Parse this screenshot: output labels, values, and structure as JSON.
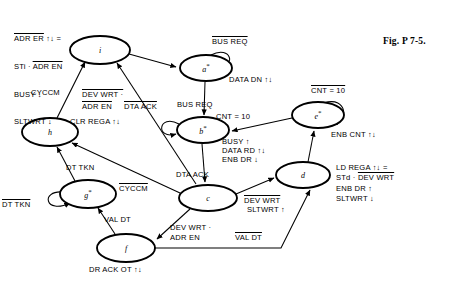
{
  "figure": {
    "caption": "Fig. P 7-5.",
    "title_note": "ASM / state-transition diagram",
    "background": "#ffffff",
    "ink": "#000000"
  },
  "states": [
    {
      "id": "i",
      "label": "i",
      "starred": false,
      "cx": 100,
      "cy": 50,
      "rx": 30,
      "ry": 14
    },
    {
      "id": "a",
      "label": "a",
      "starred": true,
      "cx": 206,
      "cy": 68,
      "rx": 26,
      "ry": 13
    },
    {
      "id": "b",
      "label": "b",
      "starred": true,
      "cx": 203,
      "cy": 130,
      "rx": 26,
      "ry": 13
    },
    {
      "id": "c",
      "label": "c",
      "starred": false,
      "cx": 208,
      "cy": 198,
      "rx": 29,
      "ry": 13
    },
    {
      "id": "d",
      "label": "d",
      "starred": false,
      "cx": 303,
      "cy": 175,
      "rx": 27,
      "ry": 13
    },
    {
      "id": "e",
      "label": "e",
      "starred": true,
      "cx": 318,
      "cy": 115,
      "rx": 26,
      "ry": 13
    },
    {
      "id": "f",
      "label": "f",
      "starred": false,
      "cx": 126,
      "cy": 248,
      "rx": 29,
      "ry": 14
    },
    {
      "id": "g",
      "label": "g",
      "starred": true,
      "cx": 88,
      "cy": 194,
      "rx": 28,
      "ry": 14
    },
    {
      "id": "h",
      "label": "h",
      "starred": false,
      "cx": 50,
      "cy": 132,
      "rx": 28,
      "ry": 14
    }
  ],
  "output_blocks": {
    "i_state": {
      "lines": [
        {
          "text": "ADR ER ↑↓ =",
          "overline_part": "ADR ER"
        },
        {
          "text": "STi · ADR EN",
          "overline_part": "ADR EN"
        },
        {
          "text": "BUSY ↓",
          "overline_part": ""
        },
        {
          "text": "SLTWRT ↓",
          "overline_part": ""
        }
      ]
    },
    "a_state": {
      "lines": [
        {
          "text": "DATA DN ↑↓"
        }
      ]
    },
    "b_state": {
      "lines": [
        {
          "text": "BUSY ↑"
        },
        {
          "text": "DATA RD ↑↓"
        },
        {
          "text": "ENB DR ↓"
        }
      ]
    },
    "e_state": {
      "lines": [
        {
          "text": "ENB CNT ↑↓"
        }
      ]
    },
    "d_state": {
      "lines": [
        {
          "text": "LD REGA ↑↓ ="
        },
        {
          "text": "STd · DEV WRT",
          "overline_part": "DEV WRT"
        },
        {
          "text": "ENB DR ↑"
        },
        {
          "text": "SLTWRT ↓"
        }
      ]
    },
    "h_state": {
      "lines": [
        {
          "text": "CLR REGA ↑↓"
        }
      ]
    },
    "f_state": {
      "lines": [
        {
          "text": "DR ACK OT ↑↓"
        }
      ]
    }
  },
  "edge_labels": [
    {
      "name": "bus-req-self-a",
      "text": "BUS REQ",
      "overline": true,
      "x": 212,
      "y": 42
    },
    {
      "name": "data-dn-a",
      "text": "DATA DN ↑↓",
      "overline": false,
      "x": 229,
      "y": 80
    },
    {
      "name": "bus-req-a-to-b",
      "text": "BUS REQ",
      "overline": false,
      "x": 177,
      "y": 104
    },
    {
      "name": "dta-ack-self-b",
      "text": "DTA ACK",
      "overline": true,
      "x": 124,
      "y": 106
    },
    {
      "name": "cnt-10-e-to-b",
      "text": "CNT = 10",
      "overline": false,
      "x": 216,
      "y": 115
    },
    {
      "name": "cnt-10-self-e",
      "text": "CNT = 10",
      "overline": true,
      "x": 313,
      "y": 88
    },
    {
      "name": "enb-cnt-e",
      "text": "ENB CNT ↑↓",
      "overline": false,
      "x": 332,
      "y": 132
    },
    {
      "name": "busy-up-b",
      "text": "BUSY ↑",
      "overline": false,
      "x": 222,
      "y": 140
    },
    {
      "name": "data-rd-b",
      "text": "DATA RD ↑↓",
      "overline": false,
      "x": 222,
      "y": 149
    },
    {
      "name": "enb-dr-down-b",
      "text": "ENB DR ↓",
      "overline": false,
      "x": 222,
      "y": 158
    },
    {
      "name": "dta-ack-b-to-c",
      "text": "DTA ACK",
      "overline": false,
      "x": 177,
      "y": 174
    },
    {
      "name": "ld-rega-d-1",
      "text": "LD REGA ↑↓ =",
      "overline": false,
      "x": 337,
      "y": 166
    },
    {
      "name": "ld-rega-d-2",
      "text": "STd · DEV WRT",
      "overline": false,
      "x": 337,
      "y": 176
    },
    {
      "name": "ld-rega-d-3",
      "text": "ENB DR ↑",
      "overline": false,
      "x": 337,
      "y": 187
    },
    {
      "name": "ld-rega-d-4",
      "text": "SLTWRT ↓",
      "overline": false,
      "x": 337,
      "y": 197
    },
    {
      "name": "cyccm-h-to-i",
      "text": "CYCCM",
      "overline": false,
      "x": 33,
      "y": 92
    },
    {
      "name": "dev-wrt-c-to-i-1",
      "text": "DEV WRT ·",
      "overline": true,
      "x": 82,
      "y": 94
    },
    {
      "name": "dev-wrt-c-to-i-2",
      "text": "ADR EN",
      "overline": true,
      "x": 82,
      "y": 106
    },
    {
      "name": "clr-rega-h",
      "text": "CLR REGA ↑↓",
      "overline": false,
      "x": 72,
      "y": 120
    },
    {
      "name": "dt-tkn-g-to-h",
      "text": "DT TKN",
      "overline": false,
      "x": 67,
      "y": 166
    },
    {
      "name": "dt-tkn-self-g",
      "text": "DT TKN",
      "overline": true,
      "x": 3,
      "y": 203
    },
    {
      "name": "cyccm-c-to-h",
      "text": "CYCCM",
      "overline": true,
      "x": 120,
      "y": 188
    },
    {
      "name": "val-dt-f-to-g",
      "text": "VAL DT",
      "overline": false,
      "x": 105,
      "y": 218
    },
    {
      "name": "dev-wrt-c-to-f-1",
      "text": "DEV WRT ·",
      "overline": false,
      "x": 171,
      "y": 226
    },
    {
      "name": "dev-wrt-c-to-f-2",
      "text": "ADR EN",
      "overline": false,
      "x": 171,
      "y": 236
    },
    {
      "name": "dev-wrt-c-to-d-1",
      "text": "DEV WRT",
      "overline": true,
      "x": 245,
      "y": 198
    },
    {
      "name": "dev-wrt-c-to-d-2",
      "text": "SLTWRT ↑",
      "overline": false,
      "x": 248,
      "y": 208
    },
    {
      "name": "val-dt-f-to-d",
      "text": "VAL DT",
      "overline": true,
      "x": 236,
      "y": 236
    },
    {
      "name": "dr-ack-ot-f",
      "text": "DR ACK OT ↑↓",
      "overline": false,
      "x": 90,
      "y": 268
    }
  ],
  "top_left_block": {
    "line1": "ADR ER ↑↓ =",
    "line1_over": "ADR ER",
    "line2_pre": "STi · ",
    "line2_over": "ADR EN",
    "line3": "BUSY ↓",
    "line4": "SLTWRT ↓",
    "x": 14,
    "y": 16
  },
  "transitions": [
    {
      "from": "i",
      "to": "a",
      "condition": ""
    },
    {
      "from": "a",
      "to": "a",
      "condition": "BUS REQ (bar)"
    },
    {
      "from": "a",
      "to": "b",
      "condition": "BUS REQ"
    },
    {
      "from": "b",
      "to": "b",
      "condition": "DTA ACK (bar)"
    },
    {
      "from": "b",
      "to": "c",
      "condition": "DTA ACK"
    },
    {
      "from": "e",
      "to": "e",
      "condition": "CNT = 10 (bar)"
    },
    {
      "from": "e",
      "to": "b",
      "condition": "CNT = 10"
    },
    {
      "from": "d",
      "to": "e",
      "condition": ""
    },
    {
      "from": "c",
      "to": "d",
      "condition": "DEV WRT (bar) · SLTWRT ↑"
    },
    {
      "from": "c",
      "to": "f",
      "condition": "DEV WRT · ADR EN"
    },
    {
      "from": "c",
      "to": "h",
      "condition": "CYCCM (bar)"
    },
    {
      "from": "c",
      "to": "i",
      "condition": "DEV WRT (bar) · ADR EN (bar)"
    },
    {
      "from": "f",
      "to": "g",
      "condition": "VAL DT"
    },
    {
      "from": "f",
      "to": "d",
      "condition": "VAL DT (bar)"
    },
    {
      "from": "g",
      "to": "g",
      "condition": "DT TKN (bar)"
    },
    {
      "from": "g",
      "to": "h",
      "condition": "DT TKN"
    },
    {
      "from": "h",
      "to": "i",
      "condition": "CYCCM"
    }
  ]
}
